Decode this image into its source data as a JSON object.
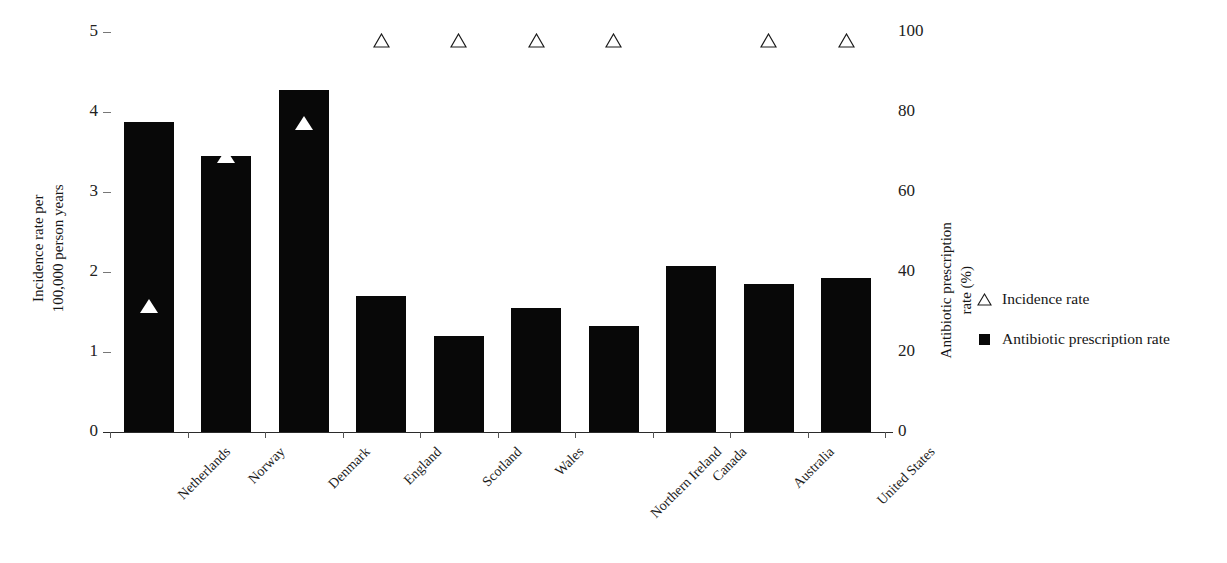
{
  "chart_data": {
    "type": "bar",
    "title": "",
    "subtitle": "",
    "xlabel": "",
    "ylabel": "Incidence rate per 100,000 person years",
    "ylabel_line1": "Incidence rate per",
    "ylabel_line2": "100,000 person years",
    "y2label": "Antibiotic prescription rate (%)",
    "y2label_line1": "Antibiotic prescription",
    "y2label_line2": "rate (%)",
    "grid": false,
    "legend_position": "right",
    "ylim": [
      0,
      5
    ],
    "y2lim": [
      0,
      100
    ],
    "yticks": [
      "0",
      "1",
      "2",
      "3",
      "4",
      "5"
    ],
    "y2ticks": [
      "0",
      "20",
      "40",
      "60",
      "80",
      "100"
    ],
    "categories": [
      "Netherlands",
      "Norway",
      "Denmark",
      "England",
      "Scotland",
      "Wales",
      "Northern Ireland",
      "Canada",
      "Australia",
      "United States"
    ],
    "series": [
      {
        "name": "Antibiotic prescription rate",
        "axis": "right",
        "marker": "filled-square",
        "color": "#080808",
        "unit": "%",
        "values": [
          77.5,
          69.0,
          85.5,
          34.0,
          24.0,
          31.0,
          26.5,
          41.5,
          37.0,
          38.5
        ]
      },
      {
        "name": "Incidence rate",
        "axis": "left",
        "marker": "triangle",
        "color": "#080808",
        "unit": "per 100,000 person years",
        "values": [
          1.57,
          3.45,
          3.86,
          4.9,
          4.9,
          4.9,
          4.9,
          null,
          4.9,
          4.9
        ],
        "marker_style": [
          "filled",
          "filled",
          "filled",
          "open",
          "open",
          "open",
          "open",
          "none",
          "open",
          "open"
        ]
      }
    ]
  },
  "legend": {
    "items": [
      {
        "label": "Incidence rate",
        "symbol": "open-triangle"
      },
      {
        "label": "Antibiotic prescription rate",
        "symbol": "filled-square"
      }
    ]
  },
  "colors": {
    "bar": "#080808",
    "marker_fill": "#ffffff",
    "marker_stroke": "#1a1a1a",
    "axis": "#2b2b2b",
    "background": "#ffffff"
  }
}
